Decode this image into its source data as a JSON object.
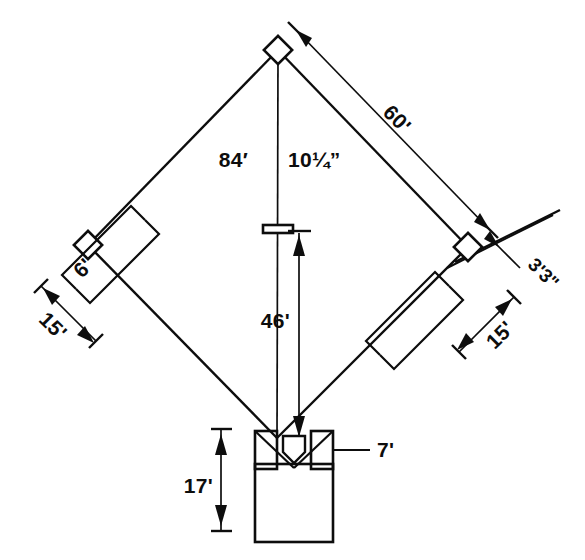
{
  "diagram": {
    "labels": {
      "home_to_second": "84' 10¼\"",
      "base_path": "60'",
      "pitching_distance": "46'",
      "backstop_distance": "17'",
      "batters_box_area": "7'",
      "coach_box_width_left": "6'",
      "coach_box_length_left": "15'",
      "first_base_offset": "3'3\"",
      "coach_box_length_right": "15'"
    },
    "elements": {
      "second_base": "second-base",
      "third_base": "third-base",
      "first_base": "first-base",
      "home_plate": "home-plate",
      "pitchers_rubber": "pitchers-rubber",
      "left_batters_box": "left-batters-box",
      "right_batters_box": "right-batters-box",
      "backstop": "backstop",
      "left_coachs_box": "left-coachs-box",
      "right_coachs_box": "right-coachs-box",
      "left_foul_line": "left-foul-line",
      "right_foul_line": "right-foul-line"
    },
    "colors": {
      "ink": "#0d0d0d",
      "paper": "#ffffff"
    }
  }
}
